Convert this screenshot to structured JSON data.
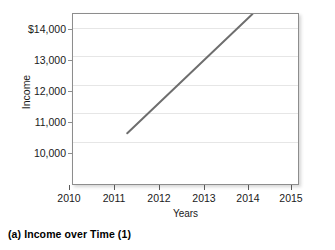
{
  "caption": "(a)  Income over Time (1)",
  "chart_data": {
    "type": "line",
    "title": "",
    "xlabel": "Years",
    "ylabel": "Income",
    "grid": "horizontal",
    "legend": "none",
    "xlim": [
      2009.57,
      2015.5
    ],
    "ylim": [
      8450,
      14480
    ],
    "x_ticks": [
      2010,
      2011,
      2012,
      2013,
      2014,
      2015
    ],
    "x_tick_labels": [
      "2010",
      "2011",
      "2012",
      "2013",
      "2014",
      "2015"
    ],
    "y_ticks": [
      10000,
      11000,
      12000,
      13000,
      14000
    ],
    "y_tick_labels": [
      "10,000",
      "11,000",
      "12,000",
      "13,000",
      "$14,000"
    ],
    "series": [
      {
        "name": "Income",
        "color": "#6e6e6e",
        "x": [
          2011,
          2014.3
        ],
        "values": [
          10250,
          14480
        ],
        "points": [
          {
            "x": 2011,
            "y": 10250
          },
          {
            "x": 2014.3,
            "y": 14480
          }
        ]
      }
    ],
    "annotations": []
  }
}
